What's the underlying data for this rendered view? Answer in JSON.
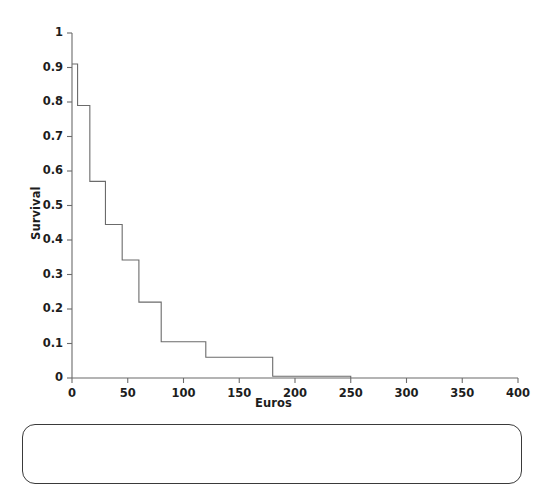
{
  "chart_data": {
    "type": "line",
    "subtype": "step-function-survival-curve",
    "title": "",
    "xlabel": "Euros",
    "ylabel": "Survival",
    "xlim": [
      0,
      400
    ],
    "ylim": [
      0,
      1
    ],
    "grid": false,
    "legend": null,
    "xticks": [
      0,
      50,
      100,
      150,
      200,
      250,
      300,
      350,
      400
    ],
    "xtick_labels": [
      "0",
      "50",
      "100",
      "150",
      "200",
      "250",
      "300",
      "350",
      "400"
    ],
    "yticks": [
      0,
      0.1,
      0.2,
      0.3,
      0.4,
      0.5,
      0.6,
      0.7,
      0.8,
      0.9,
      1
    ],
    "ytick_labels": [
      "0",
      "0.1",
      "0.2",
      "0.3",
      "0.4",
      "0.5",
      "0.6",
      "0.7",
      "0.8",
      "0.9",
      "1"
    ],
    "line_color": "#6b6b6b",
    "line_width": 1.1,
    "x": [
      0,
      5,
      5,
      16,
      16,
      30,
      30,
      45,
      45,
      60,
      60,
      80,
      80,
      120,
      120,
      180,
      180,
      250,
      250
    ],
    "y": [
      0.91,
      0.91,
      0.79,
      0.79,
      0.57,
      0.57,
      0.445,
      0.445,
      0.342,
      0.342,
      0.22,
      0.22,
      0.105,
      0.105,
      0.06,
      0.06,
      0.005,
      0.005,
      0.0
    ],
    "steps": [
      {
        "x_start": 0,
        "x_end": 5,
        "survival": 0.91
      },
      {
        "x_start": 5,
        "x_end": 16,
        "survival": 0.79
      },
      {
        "x_start": 16,
        "x_end": 30,
        "survival": 0.57
      },
      {
        "x_start": 30,
        "x_end": 45,
        "survival": 0.445
      },
      {
        "x_start": 45,
        "x_end": 60,
        "survival": 0.342
      },
      {
        "x_start": 60,
        "x_end": 80,
        "survival": 0.22
      },
      {
        "x_start": 80,
        "x_end": 120,
        "survival": 0.105
      },
      {
        "x_start": 120,
        "x_end": 180,
        "survival": 0.06
      },
      {
        "x_start": 180,
        "x_end": 250,
        "survival": 0.005
      },
      {
        "x_start": 250,
        "x_end": 250,
        "survival": 0.0
      }
    ]
  },
  "caption": {
    "text": ""
  }
}
